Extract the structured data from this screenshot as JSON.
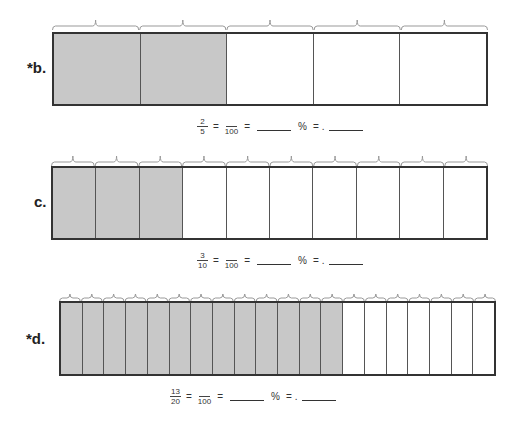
{
  "problems": [
    {
      "id": "b",
      "label": "*b.",
      "segments": 5,
      "shaded": 2,
      "equation": {
        "numerator": "2",
        "denominator": "5",
        "hundred_denominator": "100",
        "equals": "=",
        "percent_sign": "%",
        "decimal_point": "."
      }
    },
    {
      "id": "c",
      "label": "c.",
      "segments": 10,
      "shaded": 3,
      "equation": {
        "numerator": "3",
        "denominator": "10",
        "hundred_denominator": "100",
        "equals": "=",
        "percent_sign": "%",
        "decimal_point": "."
      }
    },
    {
      "id": "d",
      "label": "*d.",
      "segments": 20,
      "shaded": 13,
      "equation": {
        "numerator": "13",
        "denominator": "20",
        "hundred_denominator": "100",
        "equals": "=",
        "percent_sign": "%",
        "decimal_point": "."
      }
    }
  ],
  "colors": {
    "shaded": "#c8c8c8",
    "border": "#333333",
    "brace": "#999999"
  }
}
